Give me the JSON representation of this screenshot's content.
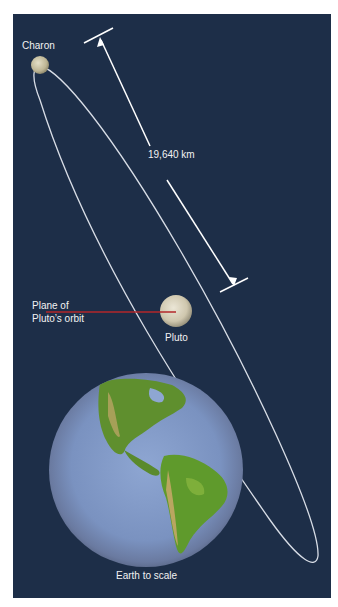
{
  "figure": {
    "background_color": "#1d2e48",
    "orbit_color": "#d8dde6",
    "orbit_plane_color": "#b3272a"
  },
  "labels": {
    "charon": "Charon",
    "distance": "19,640 km",
    "plane_line1": "Plane of",
    "plane_line2": "Pluto’s orbit",
    "pluto": "Pluto",
    "earth": "Earth to scale"
  },
  "bodies": [
    {
      "name": "Charon",
      "color": "#c9c3a6"
    },
    {
      "name": "Pluto",
      "color": "#d6cfb8"
    },
    {
      "name": "Earth",
      "ocean_color": "#7e97c4",
      "land_color": "#5f8f2e"
    }
  ]
}
